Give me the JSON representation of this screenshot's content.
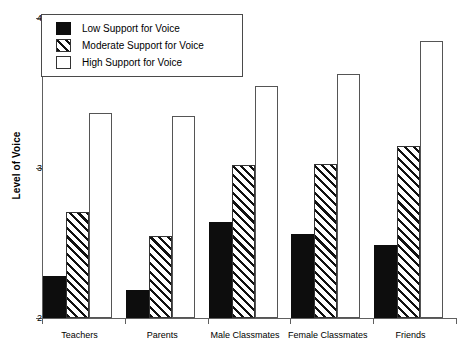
{
  "chart_data": {
    "type": "bar",
    "title": "",
    "xlabel": "",
    "ylabel": "Level of Voice",
    "ylim": [
      2,
      4
    ],
    "yticks": [
      2,
      3,
      4
    ],
    "ytick_labels": [
      "2",
      "3",
      "4"
    ],
    "grid": false,
    "legend_position": "top-left",
    "categories": [
      "Teachers",
      "Parents",
      "Male Classmates",
      "Female Classmates",
      "Friends"
    ],
    "series": [
      {
        "name": "Low Support for Voice",
        "fill": "solid-black",
        "values": [
          2.28,
          2.19,
          2.64,
          2.56,
          2.49
        ]
      },
      {
        "name": "Moderate Support for Voice",
        "fill": "diagonal-hatch",
        "values": [
          2.71,
          2.55,
          3.02,
          3.03,
          3.15
        ]
      },
      {
        "name": "High Support for Voice",
        "fill": "white",
        "values": [
          3.37,
          3.35,
          3.55,
          3.63,
          3.85
        ]
      }
    ]
  },
  "legend": {
    "items": [
      {
        "label": "Low Support for Voice",
        "swatch": "low"
      },
      {
        "label": "Moderate Support for Voice",
        "swatch": "moderate"
      },
      {
        "label": "High Support for Voice",
        "swatch": "high"
      }
    ]
  },
  "colors": {
    "low": "#0d0d0d",
    "moderate": "#ffffff",
    "high": "#ffffff",
    "axis": "#606060",
    "background": "#ffffff"
  }
}
